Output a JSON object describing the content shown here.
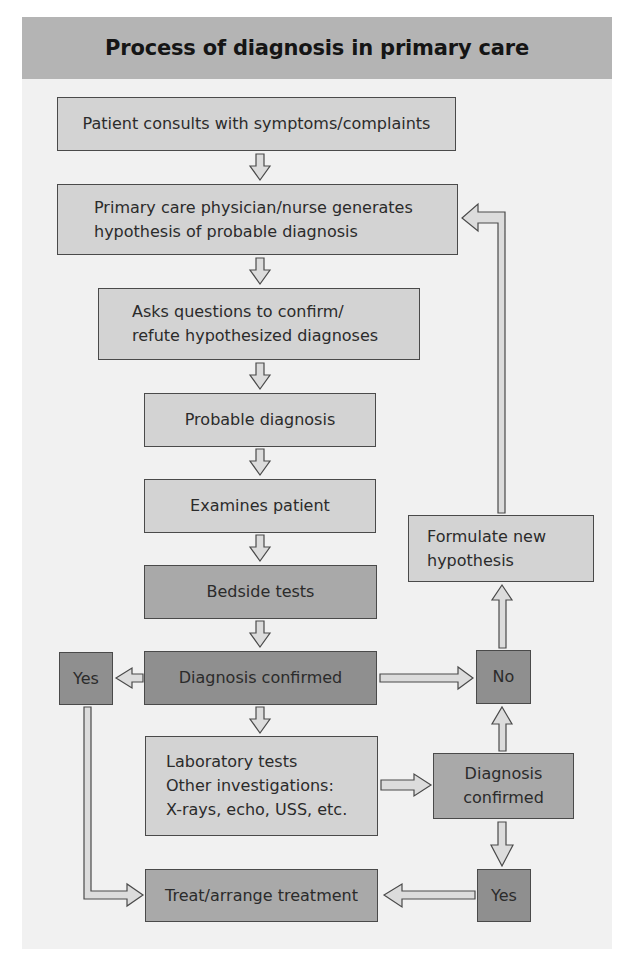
{
  "title": "Process of diagnosis in primary care",
  "colors": {
    "title_bar": "#b4b4b4",
    "panel_bg": "#f1f1f1",
    "box_light": "#d3d3d3",
    "box_mid": "#a9a9a9",
    "box_dark": "#8f8f8f",
    "border": "#4a4a4a",
    "arrow_fill": "#dcdcdc"
  },
  "nodes": {
    "patient_consults": "Patient consults with symptoms/complaints",
    "generates_hypothesis": {
      "line1": "Primary care physician/nurse generates",
      "line2": "hypothesis of probable diagnosis"
    },
    "asks_questions": {
      "line1": "Asks questions to confirm/",
      "line2": "refute hypothesized diagnoses"
    },
    "probable_diagnosis": "Probable diagnosis",
    "examines_patient": "Examines patient",
    "bedside_tests": "Bedside tests",
    "diagnosis_confirmed_1": "Diagnosis confirmed",
    "yes_left": "Yes",
    "no_right": "No",
    "formulate_hypothesis": {
      "line1": "Formulate new",
      "line2": "hypothesis"
    },
    "lab_tests": {
      "line1": "Laboratory tests",
      "line2": "Other investigations:",
      "line3": "X-rays, echo, USS, etc."
    },
    "diagnosis_confirmed_2": {
      "line1": "Diagnosis",
      "line2": "confirmed"
    },
    "yes_bottom": "Yes",
    "treat": "Treat/arrange treatment"
  }
}
